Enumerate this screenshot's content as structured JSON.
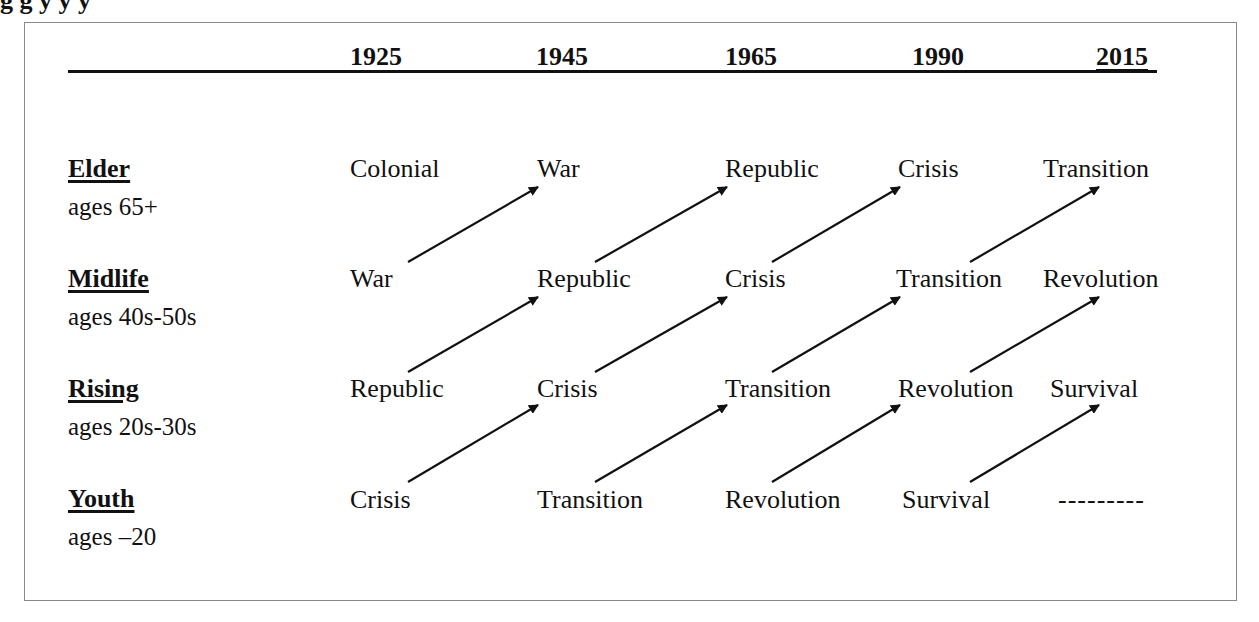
{
  "caption_fragment": "g                                                     g                                                                                  y         y                    y",
  "header": {
    "years": [
      "1925",
      "1945",
      "1965",
      "1990",
      "2015"
    ]
  },
  "rows": [
    {
      "label": "Elder",
      "ages": "ages 65+",
      "cells": [
        "Colonial",
        "War",
        "Republic",
        "Crisis",
        "Transition"
      ]
    },
    {
      "label": "Midlife",
      "ages": "ages 40s-50s",
      "cells": [
        "War",
        "Republic",
        "Crisis",
        "Transition",
        "Revolution"
      ]
    },
    {
      "label": "Rising",
      "ages": "ages 20s-30s",
      "cells": [
        "Republic",
        "Crisis",
        "Transition",
        "Revolution",
        "Survival"
      ]
    },
    {
      "label": "Youth",
      "ages": "ages –20",
      "cells": [
        "Crisis",
        "Transition",
        "Revolution",
        "Survival",
        "---------"
      ]
    }
  ],
  "arrows": {
    "description": "Each generation moves diagonally up-right to the next life stage in the following period",
    "color": "#111111"
  }
}
